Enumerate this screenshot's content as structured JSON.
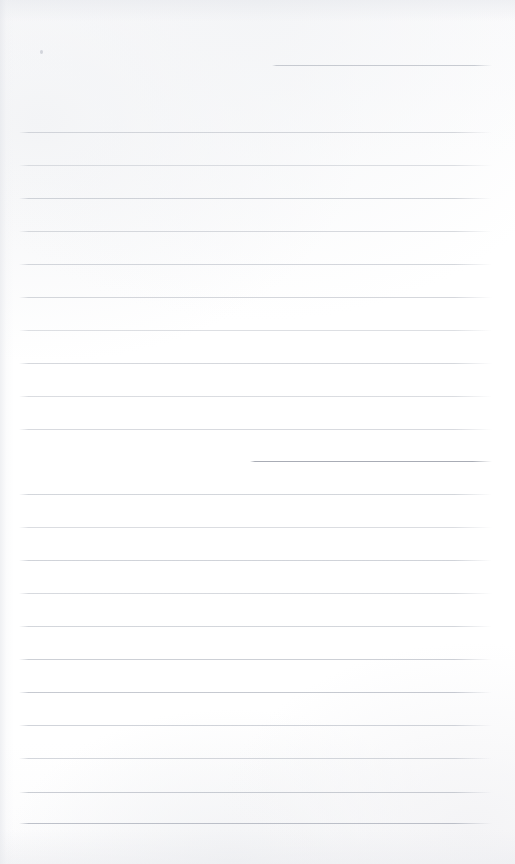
{
  "document": {
    "type": "scanned-ruled-paper",
    "title": "Blank ruled notebook page",
    "page_width": 515,
    "page_height": 864,
    "background_color": "#fdfdfd",
    "paper_tone": "#ffffff",
    "text_content": "",
    "body_text": "",
    "has_handwriting": false,
    "has_printed_text": false
  },
  "ruling": {
    "line_color": "#b8bcc4",
    "line_color_dark": "#9095a0",
    "line_thickness_px": 1,
    "default_left_px": 19,
    "default_right_px": 492,
    "nominal_spacing_px": 33,
    "line_count": 23
  },
  "lines": [
    {
      "id": "line-01",
      "y": 65,
      "left": 272,
      "right": 492,
      "opacity": 0.62,
      "color": "#a9aeb8",
      "partial": true
    },
    {
      "id": "line-02",
      "y": 132,
      "left": 19,
      "right": 492,
      "opacity": 0.58,
      "color": "#b8bcc4",
      "partial": false
    },
    {
      "id": "line-03",
      "y": 165,
      "left": 19,
      "right": 492,
      "opacity": 0.5,
      "color": "#bcc0c8",
      "partial": false
    },
    {
      "id": "line-04",
      "y": 198,
      "left": 19,
      "right": 492,
      "opacity": 0.6,
      "color": "#b4b9c2",
      "partial": false
    },
    {
      "id": "line-05",
      "y": 231,
      "left": 19,
      "right": 492,
      "opacity": 0.55,
      "color": "#b8bcc4",
      "partial": false
    },
    {
      "id": "line-06",
      "y": 264,
      "left": 19,
      "right": 492,
      "opacity": 0.52,
      "color": "#aeb3bd",
      "partial": false
    },
    {
      "id": "line-07",
      "y": 297,
      "left": 19,
      "right": 492,
      "opacity": 0.58,
      "color": "#b6bac3",
      "partial": false
    },
    {
      "id": "line-08",
      "y": 330,
      "left": 19,
      "right": 492,
      "opacity": 0.5,
      "color": "#bbbfc7",
      "partial": false
    },
    {
      "id": "line-09",
      "y": 363,
      "left": 19,
      "right": 492,
      "opacity": 0.56,
      "color": "#b5bac3",
      "partial": false
    },
    {
      "id": "line-10",
      "y": 396,
      "left": 19,
      "right": 492,
      "opacity": 0.52,
      "color": "#b9bdc5",
      "partial": false
    },
    {
      "id": "line-11",
      "y": 429,
      "left": 19,
      "right": 492,
      "opacity": 0.54,
      "color": "#b7bbc4",
      "partial": false
    },
    {
      "id": "line-12",
      "y": 461,
      "left": 250,
      "right": 492,
      "opacity": 0.78,
      "color": "#9095a0",
      "partial": true
    },
    {
      "id": "line-13",
      "y": 494,
      "left": 19,
      "right": 492,
      "opacity": 0.58,
      "color": "#b4b9c2",
      "partial": false
    },
    {
      "id": "line-14",
      "y": 527,
      "left": 19,
      "right": 492,
      "opacity": 0.52,
      "color": "#babec6",
      "partial": false
    },
    {
      "id": "line-15",
      "y": 560,
      "left": 19,
      "right": 492,
      "opacity": 0.6,
      "color": "#b1b6c0",
      "partial": false
    },
    {
      "id": "line-16",
      "y": 593,
      "left": 19,
      "right": 492,
      "opacity": 0.55,
      "color": "#b7bbc4",
      "partial": false
    },
    {
      "id": "line-17",
      "y": 626,
      "left": 19,
      "right": 492,
      "opacity": 0.58,
      "color": "#b4b9c2",
      "partial": false
    },
    {
      "id": "line-18",
      "y": 659,
      "left": 19,
      "right": 492,
      "opacity": 0.62,
      "color": "#aeb3bd",
      "partial": false
    },
    {
      "id": "line-19",
      "y": 692,
      "left": 19,
      "right": 492,
      "opacity": 0.66,
      "color": "#a9aeb9",
      "partial": false
    },
    {
      "id": "line-20",
      "y": 725,
      "left": 19,
      "right": 492,
      "opacity": 0.6,
      "color": "#b2b7c1",
      "partial": false
    },
    {
      "id": "line-21",
      "y": 758,
      "left": 19,
      "right": 492,
      "opacity": 0.58,
      "color": "#b5bac3",
      "partial": false
    },
    {
      "id": "line-22",
      "y": 792,
      "left": 19,
      "right": 492,
      "opacity": 0.64,
      "color": "#adb2bc",
      "partial": false
    },
    {
      "id": "line-23",
      "y": 823,
      "left": 19,
      "right": 492,
      "opacity": 0.7,
      "color": "#a3a8b4",
      "partial": false
    }
  ],
  "artifacts": [
    {
      "id": "speck-1",
      "x": 40,
      "y": 50,
      "kind": "dust-speck"
    }
  ]
}
